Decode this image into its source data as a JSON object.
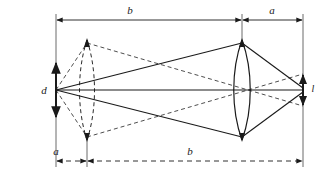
{
  "figure": {
    "background_color": "#ffffff",
    "line_color": "#1a1a1a",
    "dashed_color": "#4a4a4a"
  },
  "labels": {
    "object_height": "d",
    "image_height": "l",
    "top_long_segment": "b",
    "top_short_segment": "a",
    "bottom_short_segment": "a",
    "bottom_long_segment": "b"
  },
  "geometry": {
    "object_point_x": 56,
    "image_point_x": 303,
    "axis_y": 90,
    "lens_dashed_x": 87,
    "lens_solid_x": 242,
    "lens_top_y": 40,
    "lens_bottom_y": 140,
    "top_dim_y": 20,
    "bottom_dim_y": 161,
    "object_arrow_top_y": 62,
    "object_arrow_bottom_y": 118,
    "image_arrow_top_y": 74,
    "image_arrow_bottom_y": 106
  },
  "elements": {
    "lens_solid_name": "converging lens position 2 (solid)",
    "lens_dashed_name": "converging lens position 1 (dashed)",
    "optical_axis_name": "optical axis",
    "rays_solid_name": "ray bundle through solid lens",
    "rays_dashed_name": "ray bundle through dashed lens"
  }
}
